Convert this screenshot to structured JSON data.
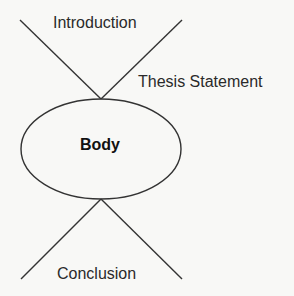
{
  "diagram": {
    "title": "",
    "labels": {
      "introduction": "Introduction",
      "thesis": "Thesis Statement",
      "body": "Body",
      "conclusion": "Conclusion"
    },
    "colors": {
      "stroke": "#333333",
      "text": "#2a2a2a",
      "background": "#f8f8f6"
    }
  }
}
